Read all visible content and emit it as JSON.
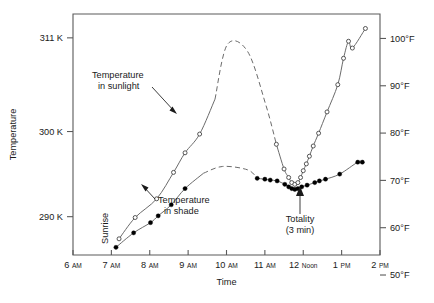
{
  "chart_data": {
    "type": "line",
    "title": "",
    "xlabel": "Time",
    "ylabel": "Temperature",
    "grid": false,
    "legend_position": "inline-annotations",
    "x_tick_labels": [
      {
        "value": 6,
        "main": "6",
        "suffix": "AM"
      },
      {
        "value": 7,
        "main": "7",
        "suffix": "AM"
      },
      {
        "value": 8,
        "main": "8",
        "suffix": "AM"
      },
      {
        "value": 9,
        "main": "9",
        "suffix": "AM"
      },
      {
        "value": 10,
        "main": "10",
        "suffix": "AM"
      },
      {
        "value": 11,
        "main": "11",
        "suffix": "AM"
      },
      {
        "value": 12,
        "main": "12",
        "suffix": "Noon"
      },
      {
        "value": 13,
        "main": "1",
        "suffix": "PM"
      },
      {
        "value": 14,
        "main": "2",
        "suffix": "PM"
      }
    ],
    "xlim": [
      6,
      14
    ],
    "y_left_axis": {
      "unit": "K",
      "ticks": [
        {
          "value": 290,
          "label": "290 K"
        },
        {
          "value": 300,
          "label": "300 K"
        },
        {
          "value": 311,
          "label": "311 K"
        }
      ],
      "ylim": [
        285.5,
        313.8
      ]
    },
    "y_right_axis": {
      "unit": "°F",
      "ticks": [
        {
          "value": 50,
          "label": "50°F"
        },
        {
          "value": 60,
          "label": "60°F"
        },
        {
          "value": 70,
          "label": "70°F"
        },
        {
          "value": 80,
          "label": "80°F"
        },
        {
          "value": 90,
          "label": "90°F"
        },
        {
          "value": 100,
          "label": "100°F"
        }
      ],
      "ylim": [
        50,
        105
      ]
    },
    "series": [
      {
        "name": "Temperature in sunlight",
        "marker": "open-circle",
        "values": [
          [
            7.2,
            287.4
          ],
          [
            7.62,
            289.9
          ],
          [
            8.18,
            292.1
          ],
          [
            8.62,
            295.2
          ],
          [
            8.92,
            297.5
          ],
          [
            9.3,
            299.7
          ],
          [
            9.7,
            303.8
          ],
          [
            10.02,
            310.2
          ],
          [
            10.55,
            309.4
          ],
          [
            11.02,
            303.2
          ],
          [
            11.3,
            298.5
          ],
          [
            11.5,
            295.6
          ],
          [
            11.62,
            294.6
          ],
          [
            11.7,
            294.0
          ],
          [
            11.78,
            293.8
          ],
          [
            11.86,
            294.0
          ],
          [
            11.93,
            294.6
          ],
          [
            12.0,
            295.4
          ],
          [
            12.08,
            296.2
          ],
          [
            12.16,
            297.1
          ],
          [
            12.26,
            298.3
          ],
          [
            12.4,
            299.8
          ],
          [
            12.62,
            302.3
          ],
          [
            12.9,
            305.5
          ],
          [
            13.05,
            308.6
          ],
          [
            13.18,
            310.6
          ],
          [
            13.28,
            309.8
          ],
          [
            13.62,
            312.1
          ]
        ]
      },
      {
        "name": "Temperature in shade",
        "marker": "filled-circle",
        "values": [
          [
            7.12,
            286.4
          ],
          [
            7.58,
            288.1
          ],
          [
            8.02,
            289.3
          ],
          [
            8.22,
            290.1
          ],
          [
            8.56,
            291.4
          ],
          [
            8.92,
            293.3
          ],
          [
            9.4,
            295.1
          ],
          [
            9.9,
            295.9
          ],
          [
            10.55,
            295.5
          ],
          [
            10.8,
            294.5
          ],
          [
            11.0,
            294.4
          ],
          [
            11.14,
            294.3
          ],
          [
            11.32,
            294.2
          ],
          [
            11.52,
            293.8
          ],
          [
            11.62,
            293.5
          ],
          [
            11.7,
            293.3
          ],
          [
            11.78,
            293.2
          ],
          [
            11.86,
            293.3
          ],
          [
            11.96,
            293.5
          ],
          [
            12.1,
            293.7
          ],
          [
            12.3,
            294.0
          ],
          [
            12.42,
            294.2
          ],
          [
            12.58,
            294.4
          ],
          [
            12.95,
            295.0
          ],
          [
            13.42,
            296.4
          ],
          [
            13.54,
            296.4
          ]
        ]
      }
    ],
    "annotations": [
      {
        "name": "sunlight-label",
        "text_line1": "Temperature",
        "text_line2": "in sunlight"
      },
      {
        "name": "shade-label",
        "text_line1": "Temperature",
        "text_line2": "in shade"
      },
      {
        "name": "totality-label",
        "text_line1": "Totality",
        "text_line2": "(3 min)"
      },
      {
        "name": "sunrise-label",
        "text_line1": "Sunrise",
        "text_line2": ""
      }
    ],
    "colors": {
      "curve": "#6b6b6b",
      "axis": "#5a5a5a",
      "text": "#1a1a1a",
      "marker_open_fill": "#ffffff",
      "marker_closed_fill": "#000000",
      "background": "#ffffff"
    }
  }
}
